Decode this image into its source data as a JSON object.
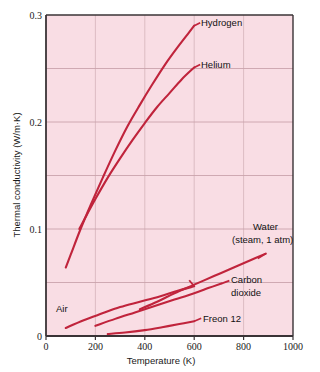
{
  "chart_data": {
    "type": "line",
    "title": "",
    "xlabel": "Temperature (K)",
    "ylabel": "Thermal conductivity (W/m·K)",
    "xlim": [
      0,
      1000
    ],
    "ylim": [
      0,
      0.3
    ],
    "xticks": [
      "0",
      "200",
      "400",
      "600",
      "800",
      "1000"
    ],
    "xtick_values": [
      0,
      200,
      400,
      600,
      800,
      1000
    ],
    "yticks": [
      "0",
      "0.1",
      "0.2",
      "0.3"
    ],
    "ytick_values": [
      0,
      0.1,
      0.2,
      0.3
    ],
    "grid": true,
    "grid_x_values": [
      200,
      400,
      600,
      800
    ],
    "grid_y_values": [
      0.05,
      0.1,
      0.15,
      0.2,
      0.25
    ],
    "legend_position": "inline-annotations",
    "line_color": "#c0243c",
    "plot_background": "#f9dde4",
    "series": [
      {
        "name": "Hydrogen",
        "label": "Hydrogen",
        "label_line1": "Hydrogen",
        "label_line2": "",
        "x": [
          80,
          100,
          140,
          180,
          230,
          280,
          330,
          380,
          430,
          480,
          530,
          580,
          600
        ],
        "y": [
          0.064,
          0.076,
          0.1,
          0.122,
          0.148,
          0.173,
          0.196,
          0.216,
          0.235,
          0.253,
          0.269,
          0.284,
          0.29
        ]
      },
      {
        "name": "Helium",
        "label": "Helium",
        "label_line1": "Helium",
        "label_line2": "",
        "x": [
          135,
          160,
          200,
          250,
          300,
          350,
          400,
          450,
          500,
          550,
          600
        ],
        "y": [
          0.1,
          0.111,
          0.128,
          0.148,
          0.166,
          0.183,
          0.199,
          0.214,
          0.227,
          0.24,
          0.251
        ]
      },
      {
        "name": "Water (steam, 1 atm)",
        "label": "Water (steam, 1 atm)",
        "label_line1": "Water",
        "label_line2": "(steam, 1 atm)",
        "x": [
          380,
          450,
          520,
          600,
          680,
          760,
          830,
          890
        ],
        "y": [
          0.025,
          0.032,
          0.04,
          0.048,
          0.056,
          0.064,
          0.071,
          0.077
        ]
      },
      {
        "name": "Carbon dioxide",
        "label": "Carbon dioxide",
        "label_line1": "Carbon",
        "label_line2": "dioxide",
        "x": [
          200,
          280,
          360,
          440,
          520,
          600,
          660,
          710
        ],
        "y": [
          0.0095,
          0.016,
          0.022,
          0.028,
          0.034,
          0.04,
          0.045,
          0.049
        ]
      },
      {
        "name": "Air",
        "label": "Air",
        "label_line1": "Air",
        "label_line2": "",
        "x": [
          80,
          150,
          220,
          300,
          380,
          460,
          530,
          600
        ],
        "y": [
          0.0075,
          0.0145,
          0.0205,
          0.027,
          0.032,
          0.037,
          0.042,
          0.0465
        ]
      },
      {
        "name": "Freon 12",
        "label": "Freon 12",
        "label_line1": "Freon 12",
        "label_line2": "",
        "x": [
          250,
          320,
          400,
          470,
          540,
          600
        ],
        "y": [
          0.0018,
          0.0032,
          0.0055,
          0.0082,
          0.0112,
          0.0138
        ]
      }
    ],
    "annotations": [
      {
        "text": "Hydrogen",
        "anchor_x": 600,
        "anchor_y": 0.29
      },
      {
        "text": "Helium",
        "anchor_x": 600,
        "anchor_y": 0.251
      },
      {
        "text": "Water (steam, 1 atm)",
        "anchor_x": 890,
        "anchor_y": 0.077
      },
      {
        "text": "Carbon dioxide",
        "anchor_x": 710,
        "anchor_y": 0.049
      },
      {
        "text": "Air",
        "anchor_x": 80,
        "anchor_y": 0.0075
      },
      {
        "text": "Freon 12",
        "anchor_x": 600,
        "anchor_y": 0.0138
      }
    ]
  },
  "labels": {
    "y_axis_title": "Thermal conductivity (W/m·K)",
    "x_axis_title": "Temperature (K)",
    "ytick_0": "0",
    "ytick_1": "0.1",
    "ytick_2": "0.2",
    "ytick_3": "0.3",
    "xtick_0": "0",
    "xtick_1": "200",
    "xtick_2": "400",
    "xtick_3": "600",
    "xtick_4": "800",
    "xtick_5": "1000",
    "series_hydrogen": "Hydrogen",
    "series_helium": "Helium",
    "series_water_l1": "Water",
    "series_water_l2": "(steam, 1 atm)",
    "series_co2_l1": "Carbon",
    "series_co2_l2": "dioxide",
    "series_air": "Air",
    "series_freon": "Freon 12"
  }
}
